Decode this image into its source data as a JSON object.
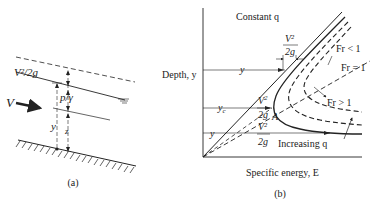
{
  "figure_a": {
    "caption": "(a)",
    "labels": {
      "velocity_head": "V²/2g",
      "pressure_head": "p/γ",
      "velocity": "V",
      "depth": "y",
      "elevation": "z"
    }
  },
  "figure_b": {
    "caption": "(b)",
    "title": "Constant q",
    "ylabel": "Depth, y",
    "xlabel": "Specific energy, E",
    "labels": {
      "v2_top_num": "V²",
      "v2_top_den": "2g",
      "y_top": "y",
      "yc": "y",
      "yc_sub": "c",
      "vc2_num": "V",
      "vc2_sup": "2",
      "vc2_sub": "c",
      "vc2_den": "2g",
      "point_a": "A",
      "y_low": "y",
      "v2_low_num": "V²",
      "v2_low_den": "2g",
      "fr_lt": "Fr < 1",
      "fr_eq": "Fr = 1",
      "fr_gt": "Fr > 1",
      "increasing_q": "Increasing q"
    }
  },
  "colors": {
    "ink": "#222222",
    "background": "#ffffff"
  }
}
